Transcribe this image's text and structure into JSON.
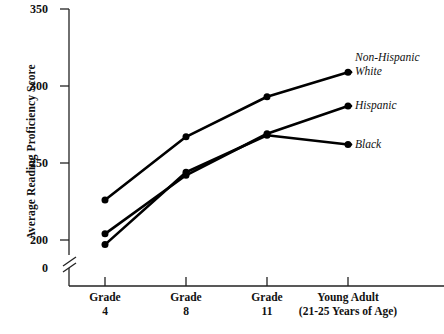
{
  "chart_data": {
    "type": "line",
    "title": "",
    "xlabel": "",
    "ylabel": "Average Reading Proficiency Score",
    "categories": [
      "Grade 4",
      "Grade 8",
      "Grade 11",
      "Young Adult (21-25 Years of Age)"
    ],
    "category_lines": [
      {
        "line1": "Grade",
        "line2": "4"
      },
      {
        "line1": "Grade",
        "line2": "8"
      },
      {
        "line1": "Grade",
        "line2": "11"
      },
      {
        "line1": "Young Adult",
        "line2": "(21-25 Years of Age)"
      }
    ],
    "series": [
      {
        "name": "Non-Hispanic White",
        "name_lines": [
          "Non-Hispanic",
          "White"
        ],
        "values": [
          226,
          267,
          293,
          309
        ]
      },
      {
        "name": "Hispanic",
        "name_lines": [
          "Hispanic"
        ],
        "values": [
          204,
          242,
          269,
          287
        ]
      },
      {
        "name": "Black",
        "name_lines": [
          "Black"
        ],
        "values": [
          197,
          244,
          268,
          262
        ]
      }
    ],
    "ylim": [
      200,
      350
    ],
    "y_ticks": [
      200,
      250,
      300,
      350
    ],
    "y_tick_labels": [
      "200",
      "250",
      "300",
      "350"
    ],
    "y_zero_label": "0",
    "axis_break": true,
    "grid": false,
    "legend_position": "right-inline",
    "line_color": "#000000",
    "marker_color": "#000000",
    "axis_color": "#222222",
    "background_color": "#ffffff"
  },
  "yticks": {
    "t350": "350",
    "t300": "300",
    "t250": "250",
    "t200": "200",
    "t0": "0"
  },
  "xticks": {
    "g4_l1": "Grade",
    "g4_l2": "4",
    "g8_l1": "Grade",
    "g8_l2": "8",
    "g11_l1": "Grade",
    "g11_l2": "11",
    "ya_l1": "Young Adult",
    "ya_l2": "(21-25 Years of Age)"
  },
  "series_labels": {
    "white_l1": "Non-Hispanic",
    "white_l2": "White",
    "hispanic": "Hispanic",
    "black": "Black"
  },
  "axis_titles": {
    "y": "Average Reading Proficiency Score"
  }
}
